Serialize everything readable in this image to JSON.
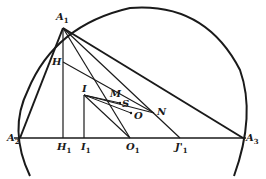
{
  "diagram": {
    "points": [
      {
        "id": "A1",
        "label": "A",
        "sub": "1",
        "x": 63,
        "y": 28
      },
      {
        "id": "A2",
        "label": "A",
        "sub": "2",
        "x": 20,
        "y": 138
      },
      {
        "id": "A3",
        "label": "A",
        "sub": "3",
        "x": 243,
        "y": 138
      },
      {
        "id": "H",
        "label": "H",
        "sub": "",
        "x": 63,
        "y": 62
      },
      {
        "id": "H1",
        "label": "H",
        "sub": "1",
        "x": 63,
        "y": 138
      },
      {
        "id": "I",
        "label": "I",
        "sub": "",
        "x": 84,
        "y": 95
      },
      {
        "id": "I1",
        "label": "I",
        "sub": "1",
        "x": 84,
        "y": 138
      },
      {
        "id": "M",
        "label": "M",
        "sub": "",
        "x": 109,
        "y": 100
      },
      {
        "id": "S",
        "label": "S",
        "sub": "",
        "x": 121,
        "y": 103
      },
      {
        "id": "O",
        "label": "O",
        "sub": "",
        "x": 133,
        "y": 113
      },
      {
        "id": "N",
        "label": "N",
        "sub": "",
        "x": 154,
        "y": 113
      },
      {
        "id": "O1",
        "label": "O",
        "sub": "1",
        "x": 130,
        "y": 138
      },
      {
        "id": "J1p",
        "label": "J'",
        "sub": "1",
        "x": 180,
        "y": 138
      }
    ],
    "labels": {
      "A1": "A",
      "A1_sub": "1",
      "A2": "A",
      "A2_sub": "2",
      "A3": "A",
      "A3_sub": "3",
      "H": "H",
      "H1": "H",
      "H1_sub": "1",
      "I": "I",
      "I1": "I",
      "I1_sub": "1",
      "M": "M",
      "S": "S",
      "O": "O",
      "N": "N",
      "O1": "O",
      "O1_sub": "1",
      "J1p": "J'",
      "J1p_sub": "1"
    },
    "colors": {
      "ink": "#1a1a1a",
      "background": "#ffffff"
    }
  }
}
